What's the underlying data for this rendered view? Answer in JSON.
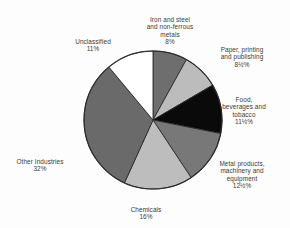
{
  "chart_data": {
    "type": "pie",
    "title": "",
    "subtitle": "",
    "xlabel": "",
    "ylabel": "",
    "legend_position": "none",
    "grid": false,
    "labels_outside": true,
    "start_angle_deg": 0,
    "direction": "clockwise",
    "categories": [
      "Iron and steel and non-ferrous metals",
      "Paper, printing and publishing",
      "Food, beverages and tobacco",
      "Metal products, machinery and equipment",
      "Chemicals",
      "Other Industries",
      "Unclassified"
    ],
    "values": [
      8,
      8.5,
      11.5,
      12.5,
      16,
      32,
      11
    ],
    "value_labels": [
      "8%",
      "8½%",
      "11½%",
      "12½%",
      "16%",
      "32%",
      "11%"
    ],
    "colors": [
      "#6e6e6e",
      "#bcbcbc",
      "#0a0a0a",
      "#787878",
      "#bdbdbd",
      "#6a6a6a",
      "#ffffff"
    ],
    "slices": [
      {
        "name": "iron-and-steel",
        "label_lines": "Iron and steel\nand non-ferrous\nmetals",
        "value": 8,
        "value_label": "8%",
        "color": "#6e6e6e"
      },
      {
        "name": "paper-printing-publishing",
        "label_lines": "Paper, printing\nand publishing",
        "value": 8.5,
        "value_label": "8½%",
        "color": "#bcbcbc"
      },
      {
        "name": "food-beverages-tobacco",
        "label_lines": "Food,\nbeverages and\ntobacco",
        "value": 11.5,
        "value_label": "11½%",
        "color": "#0a0a0a"
      },
      {
        "name": "metal-products-machinery-equipment",
        "label_lines": "Metal products,\nmachinery and\nequipment",
        "value": 12.5,
        "value_label": "12½%",
        "color": "#787878"
      },
      {
        "name": "chemicals",
        "label_lines": "Chemicals",
        "value": 16,
        "value_label": "16%",
        "color": "#bdbdbd"
      },
      {
        "name": "other-industries",
        "label_lines": "Other Industries",
        "value": 32,
        "value_label": "32%",
        "color": "#6a6a6a"
      },
      {
        "name": "unclassified",
        "label_lines": "Unclassified",
        "value": 11,
        "value_label": "11%",
        "color": "#ffffff"
      }
    ]
  },
  "style": {
    "outline_color": "#2a2a2a",
    "text_color": "#3a3a3a",
    "background": "#fdfdfd"
  }
}
